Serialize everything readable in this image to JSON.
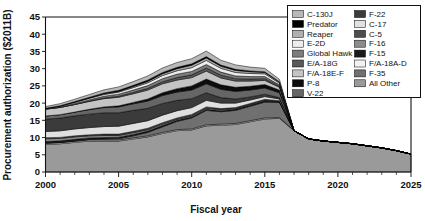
{
  "chart_data": {
    "type": "area",
    "title": "",
    "xlabel": "Fiscal year",
    "ylabel": "Procurement authorization ($2011B)",
    "xlim": [
      2000,
      2025
    ],
    "ylim": [
      0,
      45
    ],
    "xticks": [
      2000,
      2005,
      2010,
      2015,
      2020,
      2025
    ],
    "xtick_labels": [
      "2000",
      "2005",
      "2010",
      "2015",
      "2020",
      "2025"
    ],
    "yticks": [
      0,
      5,
      10,
      15,
      20,
      25,
      30,
      35,
      40,
      45
    ],
    "ytick_labels": [
      "0",
      "5",
      "10",
      "15",
      "20",
      "25",
      "30",
      "35",
      "40",
      "45"
    ],
    "minor_xtick_interval": 1,
    "grid": false,
    "stacked": true,
    "legend_position": "top-right",
    "legend_columns": 2,
    "x": [
      2000,
      2001,
      2002,
      2003,
      2004,
      2005,
      2006,
      2007,
      2008,
      2009,
      2010,
      2011,
      2012,
      2013,
      2014,
      2015,
      2016,
      2017,
      2018,
      2019,
      2020,
      2021,
      2022,
      2023,
      2024,
      2025
    ],
    "series": [
      {
        "name": "All Other",
        "color": "#9a9a9a",
        "values": [
          8.0,
          8.2,
          8.6,
          9.0,
          9.0,
          9.0,
          9.6,
          10.2,
          11.2,
          12.0,
          12.2,
          13.4,
          13.6,
          13.8,
          14.6,
          15.4,
          15.6,
          12.0,
          9.6,
          9.0,
          8.6,
          8.2,
          7.6,
          7.0,
          6.2,
          5.2
        ]
      },
      {
        "name": "F/A-18A-D",
        "color": "#f2f2f2",
        "values": [
          0.35,
          0.35,
          0.3,
          0.3,
          0.3,
          0.3,
          0.3,
          0.3,
          0.3,
          0.3,
          0.3,
          0.3,
          0.3,
          0.3,
          0.3,
          0.3,
          0.2,
          0.0,
          0.0,
          0.0,
          0.0,
          0.0,
          0.0,
          0.0,
          0.0,
          0.0
        ]
      },
      {
        "name": "F-35",
        "color": "#707070",
        "values": [
          0.0,
          0.0,
          0.1,
          0.2,
          0.3,
          0.4,
          0.6,
          1.0,
          1.6,
          2.4,
          3.2,
          4.2,
          3.6,
          3.8,
          4.2,
          4.6,
          4.4,
          0.0,
          0.0,
          0.0,
          0.0,
          0.0,
          0.0,
          0.0,
          0.0,
          0.0
        ]
      },
      {
        "name": "F-15",
        "color": "#1a1a1a",
        "values": [
          0.5,
          0.5,
          0.5,
          0.4,
          0.4,
          0.4,
          0.4,
          0.4,
          0.4,
          0.3,
          0.3,
          0.3,
          0.3,
          0.3,
          0.3,
          0.3,
          0.2,
          0.0,
          0.0,
          0.0,
          0.0,
          0.0,
          0.0,
          0.0,
          0.0,
          0.0
        ]
      },
      {
        "name": "F-16",
        "color": "#8c8c8c",
        "values": [
          0.8,
          0.7,
          0.7,
          0.6,
          0.6,
          0.5,
          0.5,
          0.4,
          0.4,
          0.3,
          0.3,
          0.3,
          0.3,
          0.2,
          0.2,
          0.2,
          0.1,
          0.0,
          0.0,
          0.0,
          0.0,
          0.0,
          0.0,
          0.0,
          0.0,
          0.0
        ]
      },
      {
        "name": "C-5",
        "color": "#4d4d4d",
        "values": [
          0.3,
          0.3,
          0.3,
          0.3,
          0.4,
          0.4,
          0.4,
          0.4,
          0.4,
          0.4,
          0.4,
          0.4,
          0.3,
          0.3,
          0.3,
          0.3,
          0.2,
          0.0,
          0.0,
          0.0,
          0.0,
          0.0,
          0.0,
          0.0,
          0.0,
          0.0
        ]
      },
      {
        "name": "C-17",
        "color": "#e0e0e0",
        "values": [
          1.8,
          1.9,
          2.0,
          2.1,
          2.2,
          2.3,
          2.3,
          2.2,
          2.2,
          2.1,
          2.0,
          1.9,
          1.6,
          1.3,
          1.0,
          0.8,
          0.5,
          0.0,
          0.0,
          0.0,
          0.0,
          0.0,
          0.0,
          0.0,
          0.0,
          0.0
        ]
      },
      {
        "name": "F-22",
        "color": "#3b3b3b",
        "values": [
          3.6,
          3.7,
          3.8,
          3.9,
          4.0,
          3.9,
          3.8,
          3.6,
          3.4,
          3.0,
          2.6,
          2.2,
          1.6,
          1.2,
          0.9,
          0.7,
          0.4,
          0.0,
          0.0,
          0.0,
          0.0,
          0.0,
          0.0,
          0.0,
          0.0,
          0.0
        ]
      },
      {
        "name": "V-22",
        "color": "#666666",
        "values": [
          0.9,
          1.0,
          1.1,
          1.3,
          1.5,
          1.7,
          1.9,
          2.1,
          2.3,
          2.4,
          2.5,
          2.6,
          2.4,
          2.2,
          2.0,
          1.8,
          1.4,
          0.0,
          0.0,
          0.0,
          0.0,
          0.0,
          0.0,
          0.0,
          0.0,
          0.0
        ]
      },
      {
        "name": "P-8",
        "color": "#0d0d0d",
        "values": [
          0.0,
          0.0,
          0.0,
          0.1,
          0.2,
          0.3,
          0.4,
          0.6,
          0.8,
          1.0,
          1.2,
          1.4,
          1.3,
          1.2,
          1.1,
          1.0,
          0.8,
          0.0,
          0.0,
          0.0,
          0.0,
          0.0,
          0.0,
          0.0,
          0.0,
          0.0
        ]
      },
      {
        "name": "F/A-18E-F",
        "color": "#c4c4c4",
        "values": [
          2.0,
          2.1,
          2.2,
          2.3,
          2.4,
          2.5,
          2.5,
          2.6,
          2.6,
          2.5,
          2.4,
          2.3,
          2.0,
          1.8,
          1.5,
          1.2,
          0.8,
          0.0,
          0.0,
          0.0,
          0.0,
          0.0,
          0.0,
          0.0,
          0.0,
          0.0
        ]
      },
      {
        "name": "E/A-18G",
        "color": "#595959",
        "values": [
          0.0,
          0.0,
          0.0,
          0.1,
          0.2,
          0.3,
          0.4,
          0.5,
          0.6,
          0.7,
          0.8,
          0.9,
          0.8,
          0.7,
          0.6,
          0.5,
          0.3,
          0.0,
          0.0,
          0.0,
          0.0,
          0.0,
          0.0,
          0.0,
          0.0,
          0.0
        ]
      },
      {
        "name": "Global Hawk",
        "color": "#7d7d7d",
        "values": [
          0.1,
          0.2,
          0.3,
          0.4,
          0.5,
          0.6,
          0.7,
          0.8,
          0.9,
          1.0,
          1.0,
          1.0,
          0.9,
          0.8,
          0.7,
          0.6,
          0.4,
          0.0,
          0.0,
          0.0,
          0.0,
          0.0,
          0.0,
          0.0,
          0.0,
          0.0
        ]
      },
      {
        "name": "E-2D",
        "color": "#ededed",
        "values": [
          0.1,
          0.2,
          0.3,
          0.4,
          0.5,
          0.6,
          0.7,
          0.8,
          0.9,
          1.0,
          1.1,
          1.2,
          1.1,
          1.0,
          0.9,
          0.8,
          0.5,
          0.0,
          0.0,
          0.0,
          0.0,
          0.0,
          0.0,
          0.0,
          0.0,
          0.0
        ]
      },
      {
        "name": "Reaper",
        "color": "#b0b0b0",
        "values": [
          0.0,
          0.0,
          0.1,
          0.1,
          0.2,
          0.2,
          0.3,
          0.4,
          0.5,
          0.6,
          0.7,
          0.7,
          0.6,
          0.6,
          0.5,
          0.4,
          0.3,
          0.0,
          0.0,
          0.0,
          0.0,
          0.0,
          0.0,
          0.0,
          0.0,
          0.0
        ]
      },
      {
        "name": "Predator",
        "color": "#000000",
        "values": [
          0.05,
          0.1,
          0.15,
          0.2,
          0.25,
          0.3,
          0.35,
          0.4,
          0.4,
          0.4,
          0.4,
          0.4,
          0.35,
          0.3,
          0.25,
          0.2,
          0.1,
          0.0,
          0.0,
          0.0,
          0.0,
          0.0,
          0.0,
          0.0,
          0.0,
          0.0
        ]
      },
      {
        "name": "C-130J",
        "color": "#b8b8b8",
        "values": [
          0.5,
          0.6,
          0.7,
          0.8,
          0.9,
          1.0,
          1.1,
          1.2,
          1.3,
          1.4,
          1.5,
          1.6,
          1.4,
          1.3,
          1.1,
          1.0,
          0.7,
          0.0,
          0.0,
          0.0,
          0.0,
          0.0,
          0.0,
          0.0,
          0.0,
          0.0
        ]
      }
    ],
    "legend": {
      "column1": [
        {
          "label": "C-130J",
          "color": "#b8b8b8"
        },
        {
          "label": "Predator",
          "color": "#000000"
        },
        {
          "label": "Reaper",
          "color": "#b0b0b0"
        },
        {
          "label": "E-2D",
          "color": "#ededed"
        },
        {
          "label": "Global Hawk",
          "color": "#7d7d7d"
        },
        {
          "label": "E/A-18G",
          "color": "#595959"
        },
        {
          "label": "F/A-18E-F",
          "color": "#c4c4c4"
        },
        {
          "label": "P-8",
          "color": "#0d0d0d"
        },
        {
          "label": "V-22",
          "color": "#666666"
        }
      ],
      "column2": [
        {
          "label": "F-22",
          "color": "#3b3b3b"
        },
        {
          "label": "C-17",
          "color": "#e0e0e0"
        },
        {
          "label": "C-5",
          "color": "#4d4d4d"
        },
        {
          "label": "F-16",
          "color": "#8c8c8c"
        },
        {
          "label": "F-15",
          "color": "#1a1a1a"
        },
        {
          "label": "F/A-18A-D",
          "color": "#f2f2f2"
        },
        {
          "label": "F-35",
          "color": "#707070"
        },
        {
          "label": "All Other",
          "color": "#9a9a9a"
        }
      ]
    }
  }
}
